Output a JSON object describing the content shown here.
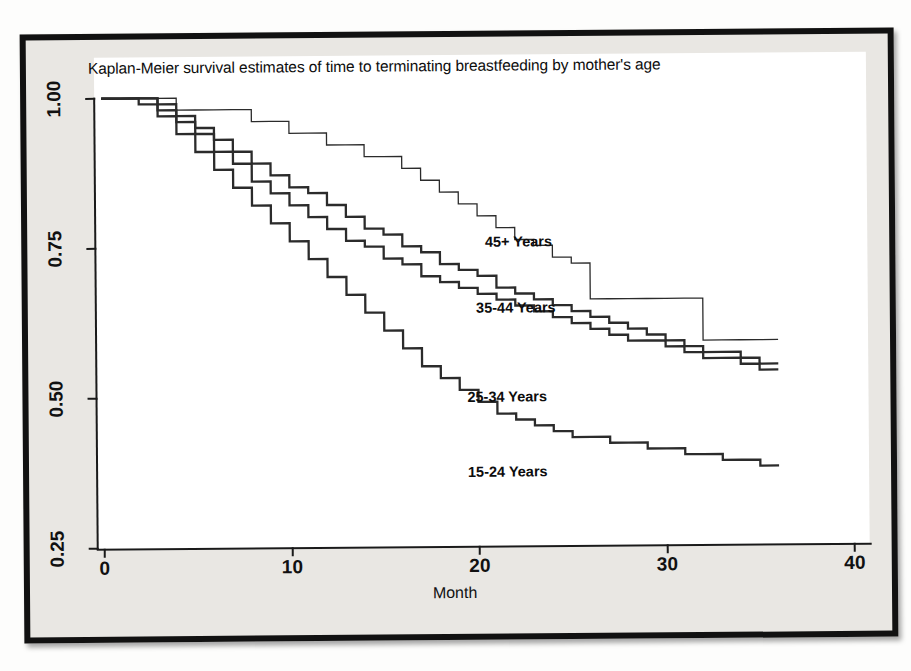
{
  "chart_data": {
    "type": "line",
    "subtype": "kaplan-meier-step",
    "title": "Kaplan-Meier survival estimates of time to terminating breastfeeding by mother's age",
    "xlabel": "Month",
    "ylabel": "",
    "xlim": [
      0,
      40
    ],
    "ylim": [
      0.25,
      1.0
    ],
    "xticks": [
      "0",
      "10",
      "20",
      "30",
      "40"
    ],
    "xtick_values": [
      0,
      10,
      20,
      30,
      40
    ],
    "yticks": [
      "1.00",
      "0.75",
      "0.50",
      "0.25"
    ],
    "ytick_values": [
      1.0,
      0.75,
      0.5,
      0.25
    ],
    "grid": false,
    "legend_position": "inline-annotations",
    "x": [
      0,
      1,
      2,
      3,
      4,
      5,
      6,
      7,
      8,
      9,
      10,
      11,
      12,
      13,
      14,
      15,
      16,
      17,
      18,
      19,
      20,
      21,
      22,
      23,
      24,
      25,
      26,
      27,
      28,
      29,
      30,
      31,
      32,
      33,
      34,
      35,
      36
    ],
    "series": [
      {
        "name": "45+ Years",
        "label": "45+ Years",
        "label_x_month": 23.5,
        "label_y_value": 0.755,
        "values": [
          1.0,
          1.0,
          1.0,
          1.0,
          0.98,
          0.98,
          0.98,
          0.98,
          0.96,
          0.96,
          0.94,
          0.94,
          0.92,
          0.92,
          0.9,
          0.9,
          0.88,
          0.86,
          0.84,
          0.82,
          0.8,
          0.78,
          0.76,
          0.75,
          0.73,
          0.72,
          0.66,
          0.66,
          0.66,
          0.66,
          0.66,
          0.66,
          0.59,
          0.59,
          0.59,
          0.59,
          0.59
        ]
      },
      {
        "name": "35-44 Years",
        "label": "35-44 Years",
        "label_x_month": 23.0,
        "label_y_value": 0.645,
        "values": [
          1.0,
          1.0,
          1.0,
          0.99,
          0.97,
          0.95,
          0.93,
          0.91,
          0.89,
          0.87,
          0.85,
          0.84,
          0.82,
          0.8,
          0.78,
          0.77,
          0.75,
          0.74,
          0.72,
          0.71,
          0.7,
          0.68,
          0.67,
          0.66,
          0.65,
          0.64,
          0.63,
          0.62,
          0.61,
          0.6,
          0.59,
          0.58,
          0.57,
          0.57,
          0.56,
          0.55,
          0.55
        ]
      },
      {
        "name": "25-34 Years",
        "label": "25-34 Years",
        "label_x_month": 22.5,
        "label_y_value": 0.497,
        "values": [
          1.0,
          1.0,
          1.0,
          0.98,
          0.96,
          0.94,
          0.91,
          0.89,
          0.86,
          0.84,
          0.82,
          0.8,
          0.78,
          0.76,
          0.75,
          0.73,
          0.72,
          0.7,
          0.69,
          0.68,
          0.67,
          0.66,
          0.65,
          0.64,
          0.63,
          0.62,
          0.61,
          0.6,
          0.59,
          0.59,
          0.58,
          0.57,
          0.56,
          0.56,
          0.55,
          0.54,
          0.54
        ]
      },
      {
        "name": "15-24 Years",
        "label": "15-24 Years",
        "label_x_month": 22.5,
        "label_y_value": 0.372,
        "values": [
          1.0,
          1.0,
          0.99,
          0.97,
          0.94,
          0.91,
          0.88,
          0.85,
          0.82,
          0.79,
          0.76,
          0.73,
          0.7,
          0.67,
          0.64,
          0.61,
          0.58,
          0.55,
          0.53,
          0.51,
          0.49,
          0.47,
          0.46,
          0.45,
          0.44,
          0.43,
          0.43,
          0.42,
          0.42,
          0.41,
          0.41,
          0.4,
          0.4,
          0.39,
          0.39,
          0.38,
          0.38
        ]
      }
    ]
  },
  "figure": {
    "title": "Kaplan-Meier survival estimates of time to terminating breastfeeding by mother's age",
    "x_axis_title": "Month"
  },
  "page_background_text": [
    {
      "text": "(L)",
      "x": 742,
      "y": 96
    },
    {
      "text": "n Hb",
      "x": 812,
      "y": 192
    },
    {
      "text": "vei",
      "x": 160,
      "y": 238
    },
    {
      "text": "ed",
      "x": 806,
      "y": 394
    },
    {
      "text": "nie",
      "x": 806,
      "y": 432
    },
    {
      "text": "ured",
      "x": 800,
      "y": 474
    },
    {
      "text": "ar Child Gender",
      "x": 700,
      "y": 596
    }
  ]
}
